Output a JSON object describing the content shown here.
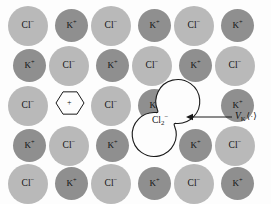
{
  "figure": {
    "width": 271,
    "height": 204,
    "background_color": "#fdfdfd"
  },
  "colors": {
    "anion_fill": "#b9b9b9",
    "cation_fill": "#8f8f8f",
    "outline": "#1a1a1a",
    "text": "#111111"
  },
  "legend_semantics": {
    "anion_species": "Cl-",
    "cation_species": "K+",
    "defect_species": "Cl2-",
    "vacancy_symbol": "+"
  },
  "lattice": {
    "rows": 5,
    "columns": 6,
    "ions": [
      {
        "species": "Cl",
        "charge": "-",
        "label": "Cl",
        "sup": "−",
        "type": "anion",
        "x": 8,
        "y": 6,
        "row": 1,
        "col": 1
      },
      {
        "species": "K",
        "charge": "+",
        "label": "K",
        "sup": "+",
        "type": "cation",
        "x": 55,
        "y": 9,
        "row": 1,
        "col": 2
      },
      {
        "species": "Cl",
        "charge": "-",
        "label": "Cl",
        "sup": "−",
        "type": "anion",
        "x": 91,
        "y": 6,
        "row": 1,
        "col": 3
      },
      {
        "species": "K",
        "charge": "+",
        "label": "K",
        "sup": "+",
        "type": "cation",
        "x": 138,
        "y": 9,
        "row": 1,
        "col": 4
      },
      {
        "species": "Cl",
        "charge": "-",
        "label": "Cl",
        "sup": "−",
        "type": "anion",
        "x": 174,
        "y": 6,
        "row": 1,
        "col": 5
      },
      {
        "species": "K",
        "charge": "+",
        "label": "K",
        "sup": "+",
        "type": "cation",
        "x": 221,
        "y": 9,
        "row": 1,
        "col": 6
      },
      {
        "species": "K",
        "charge": "+",
        "label": "K",
        "sup": "+",
        "type": "cation",
        "x": 13,
        "y": 49,
        "row": 2,
        "col": 1
      },
      {
        "species": "Cl",
        "charge": "-",
        "label": "Cl",
        "sup": "−",
        "type": "anion",
        "x": 49,
        "y": 46,
        "row": 2,
        "col": 2
      },
      {
        "species": "K",
        "charge": "+",
        "label": "K",
        "sup": "+",
        "type": "cation",
        "x": 96,
        "y": 49,
        "row": 2,
        "col": 3
      },
      {
        "species": "Cl",
        "charge": "-",
        "label": "Cl",
        "sup": "−",
        "type": "anion",
        "x": 132,
        "y": 46,
        "row": 2,
        "col": 4
      },
      {
        "species": "K",
        "charge": "+",
        "label": "K",
        "sup": "+",
        "type": "cation",
        "x": 179,
        "y": 49,
        "row": 2,
        "col": 5
      },
      {
        "species": "Cl",
        "charge": "-",
        "label": "Cl",
        "sup": "−",
        "type": "anion",
        "x": 215,
        "y": 46,
        "row": 2,
        "col": 6
      },
      {
        "species": "Cl",
        "charge": "-",
        "label": "Cl",
        "sup": "−",
        "type": "anion",
        "x": 8,
        "y": 86,
        "row": 3,
        "col": 1
      },
      {
        "species": "Cl",
        "charge": "-",
        "label": "Cl",
        "sup": "−",
        "type": "anion",
        "x": 91,
        "y": 86,
        "row": 3,
        "col": 3
      },
      {
        "species": "K",
        "charge": "+",
        "label": "K",
        "sup": "+",
        "type": "cation",
        "x": 138,
        "y": 89,
        "row": 3,
        "col": 4
      },
      {
        "species": "K",
        "charge": "+",
        "label": "K",
        "sup": "+",
        "type": "cation",
        "x": 221,
        "y": 89,
        "row": 3,
        "col": 6
      },
      {
        "species": "K",
        "charge": "+",
        "label": "K",
        "sup": "+",
        "type": "cation",
        "x": 13,
        "y": 129,
        "row": 4,
        "col": 1
      },
      {
        "species": "Cl",
        "charge": "-",
        "label": "Cl",
        "sup": "−",
        "type": "anion",
        "x": 49,
        "y": 126,
        "row": 4,
        "col": 2
      },
      {
        "species": "K",
        "charge": "+",
        "label": "K",
        "sup": "+",
        "type": "cation",
        "x": 96,
        "y": 129,
        "row": 4,
        "col": 3
      },
      {
        "species": "K",
        "charge": "+",
        "label": "K",
        "sup": "+",
        "type": "cation",
        "x": 179,
        "y": 129,
        "row": 4,
        "col": 5
      },
      {
        "species": "Cl",
        "charge": "-",
        "label": "Cl",
        "sup": "−",
        "type": "anion",
        "x": 215,
        "y": 126,
        "row": 4,
        "col": 6
      },
      {
        "species": "Cl",
        "charge": "-",
        "label": "Cl",
        "sup": "−",
        "type": "anion",
        "x": 8,
        "y": 164,
        "row": 5,
        "col": 1
      },
      {
        "species": "K",
        "charge": "+",
        "label": "K",
        "sup": "+",
        "type": "cation",
        "x": 55,
        "y": 167,
        "row": 5,
        "col": 2
      },
      {
        "species": "Cl",
        "charge": "-",
        "label": "Cl",
        "sup": "−",
        "type": "anion",
        "x": 91,
        "y": 164,
        "row": 5,
        "col": 3
      },
      {
        "species": "K",
        "charge": "+",
        "label": "K",
        "sup": "+",
        "type": "cation",
        "x": 138,
        "y": 167,
        "row": 5,
        "col": 4
      },
      {
        "species": "Cl",
        "charge": "-",
        "label": "Cl",
        "sup": "−",
        "type": "anion",
        "x": 174,
        "y": 164,
        "row": 5,
        "col": 5
      },
      {
        "species": "K",
        "charge": "+",
        "label": "K",
        "sup": "+",
        "type": "cation",
        "x": 221,
        "y": 167,
        "row": 5,
        "col": 6
      }
    ]
  },
  "vacancy": {
    "label": "+",
    "shape": "hexagon",
    "x": 56,
    "y": 89,
    "size": 28,
    "row": 3,
    "col": 2
  },
  "molecule": {
    "label_base": "Cl",
    "label_sub": "2",
    "label_sup": "−",
    "label_x": 152,
    "label_y": 116,
    "shape": "dumbbell-outline",
    "lobe1": {
      "cx": 176,
      "cy": 104,
      "r": 22
    },
    "lobe2": {
      "cx": 156,
      "cy": 132,
      "r": 22
    }
  },
  "annotation": {
    "symbol_main": "V",
    "symbol_sub": "K",
    "symbol_center": "⟨·⟩",
    "text_x": 235,
    "text_y": 112,
    "arrow": {
      "from_x": 232,
      "from_y": 117,
      "to_x": 186,
      "to_y": 117
    }
  }
}
